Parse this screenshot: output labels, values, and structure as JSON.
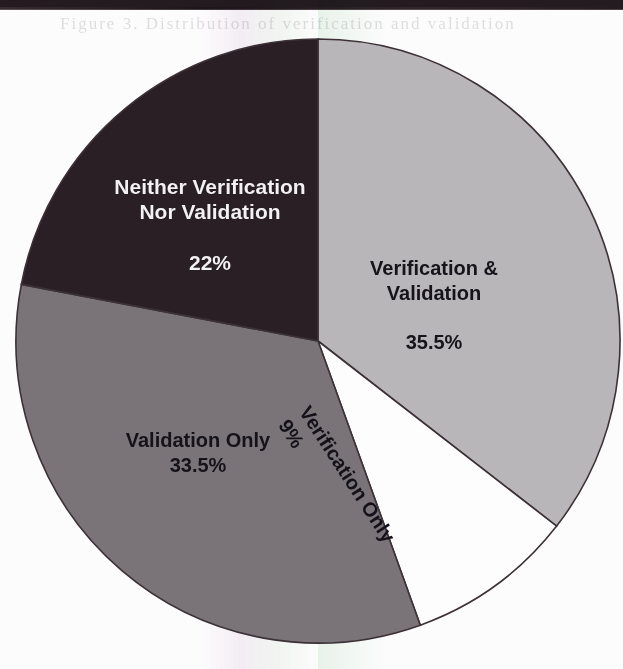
{
  "page": {
    "background_color": "#fdfcfd",
    "scan_top_bar_color": "#231b20",
    "ghost_text": "Figure 3.  Distribution of  verification  and validation"
  },
  "chart_data": {
    "type": "pie",
    "title": "",
    "subtitle": "",
    "xlabel": "",
    "ylabel": "",
    "legend_position": "none",
    "grid": false,
    "labels_inside": true,
    "center": {
      "x": 318,
      "y": 341
    },
    "radius": 302,
    "start_angle_deg": 0,
    "direction": "clockwise",
    "categories": [
      "Verification & Validation",
      "Verification Only",
      "Validation Only",
      "Neither Verification Nor Validation"
    ],
    "values": [
      35.5,
      9,
      33.5,
      22
    ],
    "value_labels": [
      "35.5%",
      "9%",
      "33.5%",
      "22%"
    ],
    "colors": [
      "#b8b6b8",
      "#fdfdfd",
      "#7a7479",
      "#2a1f24"
    ],
    "slices": [
      {
        "name": "Verification & Validation",
        "label_line1": "Verification &",
        "label_line2": "Validation",
        "percent_label": "35.5%",
        "value": 35.5,
        "color": "#b8b6b8",
        "text_color": "#17131a",
        "start_deg": 0,
        "end_deg": 127.8,
        "rotation_deg": 0
      },
      {
        "name": "Verification Only",
        "label_line1": "Verification Only",
        "label_line2": "",
        "percent_label": "9%",
        "value": 9,
        "color": "#fdfdfd",
        "text_color": "#15111a",
        "start_deg": 127.8,
        "end_deg": 160.2,
        "rotation_deg": 57
      },
      {
        "name": "Validation Only",
        "label_line1": "Validation Only",
        "label_line2": "",
        "percent_label": "33.5%",
        "value": 33.5,
        "color": "#7a7479",
        "text_color": "#16121a",
        "start_deg": 160.2,
        "end_deg": 280.8,
        "rotation_deg": 0
      },
      {
        "name": "Neither Verification Nor Validation",
        "label_line1": "Neither Verification",
        "label_line2": "Nor Validation",
        "percent_label": "22%",
        "value": 22,
        "color": "#2a1f24",
        "text_color": "#f2f0f2",
        "start_deg": 280.8,
        "end_deg": 360,
        "rotation_deg": 0
      }
    ]
  }
}
